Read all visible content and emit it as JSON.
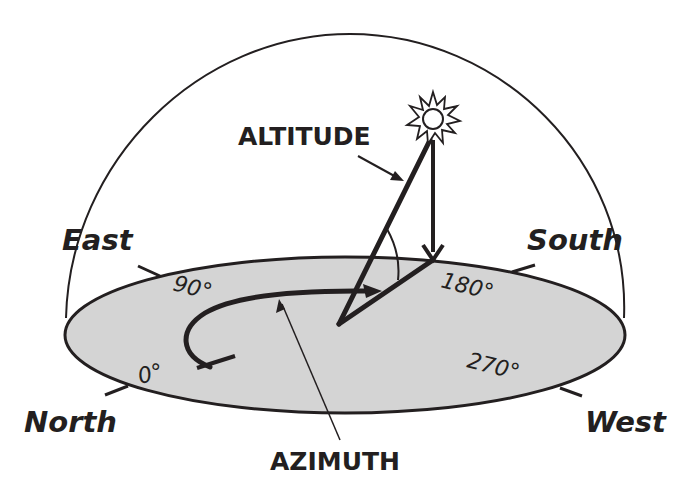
{
  "diagram": {
    "labels": {
      "altitude": "ALTITUDE",
      "azimuth": "AZIMUTH"
    },
    "directions": {
      "east": "East",
      "south": "South",
      "north": "North",
      "west": "West"
    },
    "degrees": {
      "d0": "0°",
      "d90": "90°",
      "d180": "180°",
      "d270": "270°"
    },
    "icons": {
      "sun": "sun-icon"
    },
    "colors": {
      "ink": "#231f20",
      "ground": "#d4d4d4",
      "background": "#ffffff"
    }
  }
}
